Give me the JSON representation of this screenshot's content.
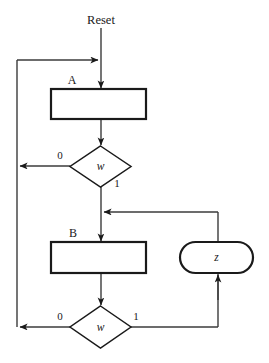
{
  "diagram": {
    "type": "asm-flowchart",
    "title_label": "Reset",
    "states": [
      {
        "id": "A",
        "label": "A",
        "shape": "rectangle"
      },
      {
        "id": "B",
        "label": "B",
        "shape": "rectangle"
      }
    ],
    "decisions": [
      {
        "id": "d1",
        "label": "w",
        "shape": "diamond",
        "exit_false": "0",
        "exit_true": "1"
      },
      {
        "id": "d2",
        "label": "w",
        "shape": "diamond",
        "exit_false": "0",
        "exit_true": "1"
      }
    ],
    "outputs": [
      {
        "id": "z",
        "label": "z",
        "shape": "stadium"
      }
    ],
    "edges": [
      {
        "from": "reset",
        "to": "A",
        "label": ""
      },
      {
        "from": "A",
        "to": "d1",
        "label": ""
      },
      {
        "from": "d1",
        "to": "A",
        "label": "0"
      },
      {
        "from": "d1",
        "to": "B",
        "label": "1"
      },
      {
        "from": "B",
        "to": "d2",
        "label": ""
      },
      {
        "from": "d2",
        "to": "A",
        "label": "0"
      },
      {
        "from": "d2",
        "to": "z",
        "label": "1"
      },
      {
        "from": "z",
        "to": "B",
        "label": ""
      }
    ],
    "colors": {
      "background": "#ffffff",
      "node_stroke": "#1a1a1a",
      "edge_stroke": "#3b3b3b",
      "text": "#1a1a1a"
    }
  }
}
